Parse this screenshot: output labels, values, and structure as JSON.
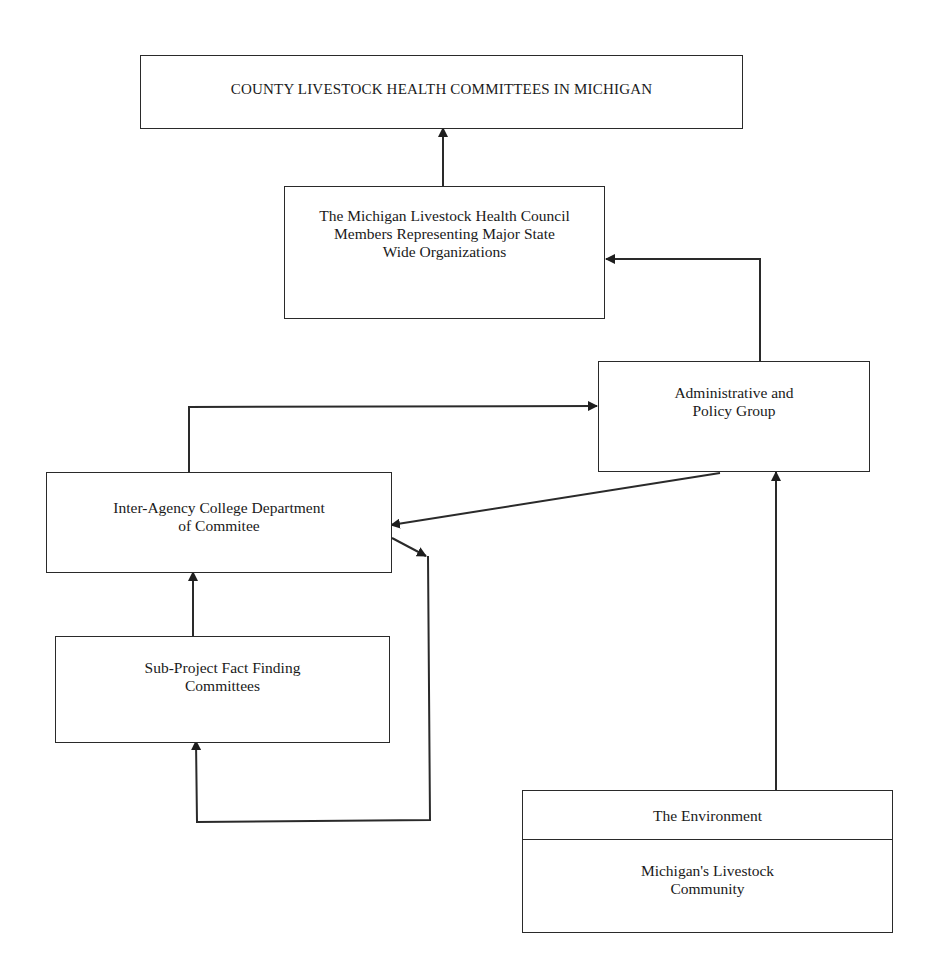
{
  "diagram": {
    "nodes": {
      "county": {
        "label": "COUNTY LIVESTOCK HEALTH COMMITTEES IN MICHIGAN"
      },
      "council": {
        "label": "The Michigan Livestock Health Council\nMembers Representing Major State\nWide Organizations"
      },
      "admin": {
        "label": "Administrative and\nPolicy Group"
      },
      "interagency": {
        "label": "Inter-Agency College Department\nof Commitee"
      },
      "subproject": {
        "label": "Sub-Project Fact Finding\nCommittees"
      },
      "environment": {
        "header": "The Environment",
        "label": "Michigan's Livestock\nCommunity"
      }
    },
    "edges": [
      {
        "from": "council",
        "to": "county"
      },
      {
        "from": "admin",
        "to": "council"
      },
      {
        "from": "interagency",
        "to": "admin"
      },
      {
        "from": "admin",
        "to": "interagency"
      },
      {
        "from": "interagency",
        "to": "subproject"
      },
      {
        "from": "subproject",
        "to": "interagency"
      },
      {
        "from": "environment",
        "to": "admin"
      }
    ],
    "colors": {
      "line": "#2a2a2a",
      "background": "#ffffff"
    }
  }
}
